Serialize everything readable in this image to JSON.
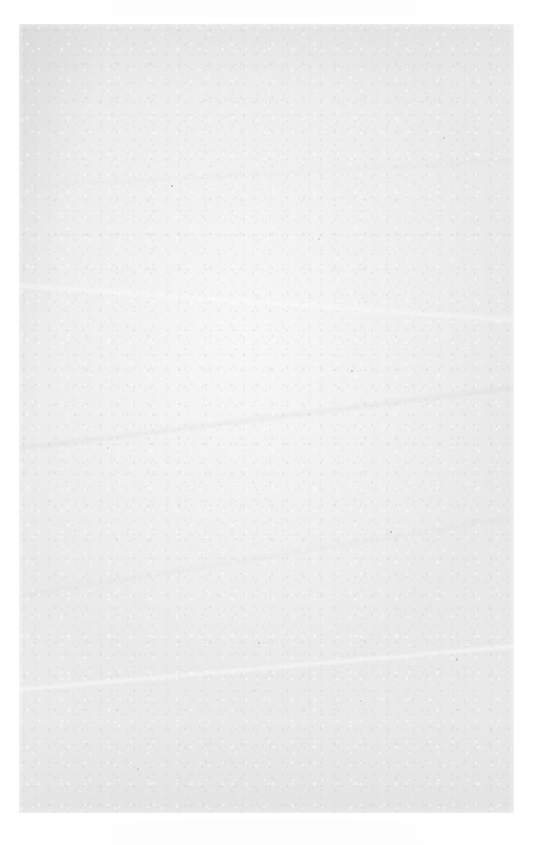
{
  "document": {
    "kind": "scanned-page",
    "page_state": "blank",
    "visible_text": "",
    "content_note": "No printed text, figures, rules, page number, or markings are visible on this page."
  },
  "canvas": {
    "width_px": 533,
    "height_px": 845,
    "background_color": "#fdfdfd"
  },
  "paper_sheet": {
    "left_px": 19,
    "top_px": 24,
    "width_px": 495,
    "height_px": 789,
    "base_color": "#eaeaea",
    "highlight_color": "#f6f6f6",
    "shadow_edge_color": "#d8d8d8",
    "texture": "paper-fiber-mottle",
    "streaks": "faint-diagonal-creases"
  },
  "scanner_margin": {
    "color": "#ffffff",
    "left_px": 19,
    "top_px": 24,
    "right_px": 19,
    "bottom_px": 32
  },
  "specks": {
    "count": 10,
    "color": "#787878",
    "description": "scattered dark paper fibers"
  }
}
